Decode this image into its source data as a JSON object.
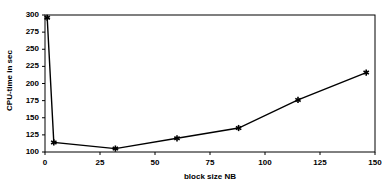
{
  "chart_data": {
    "type": "line",
    "title": "",
    "xlabel": "block size NB",
    "ylabel": "CPU-time in sec",
    "xlim": [
      0,
      150
    ],
    "ylim": [
      100,
      300
    ],
    "grid": false,
    "legend": null,
    "legend_position": "none",
    "marker": "asterisk",
    "line_color": "#000000",
    "marker_color": "#000000",
    "axis_color": "#000000",
    "background_color": "#ffffff",
    "x_ticks": [
      0,
      25,
      50,
      75,
      100,
      125,
      150
    ],
    "x_tick_labels": [
      "0",
      "25",
      "50",
      "75",
      "100",
      "125",
      "150"
    ],
    "y_ticks": [
      100,
      125,
      150,
      175,
      200,
      225,
      250,
      275,
      300
    ],
    "y_tick_labels": [
      "100",
      "125",
      "150",
      "175",
      "200",
      "225",
      "250",
      "275",
      "300"
    ],
    "series": [
      {
        "name": "CPU-time",
        "points": [
          {
            "x": 1,
            "y": 296
          },
          {
            "x": 4,
            "y": 114
          },
          {
            "x": 32,
            "y": 105
          },
          {
            "x": 60,
            "y": 120
          },
          {
            "x": 88,
            "y": 135
          },
          {
            "x": 115,
            "y": 176
          },
          {
            "x": 146,
            "y": 216
          }
        ]
      }
    ]
  }
}
